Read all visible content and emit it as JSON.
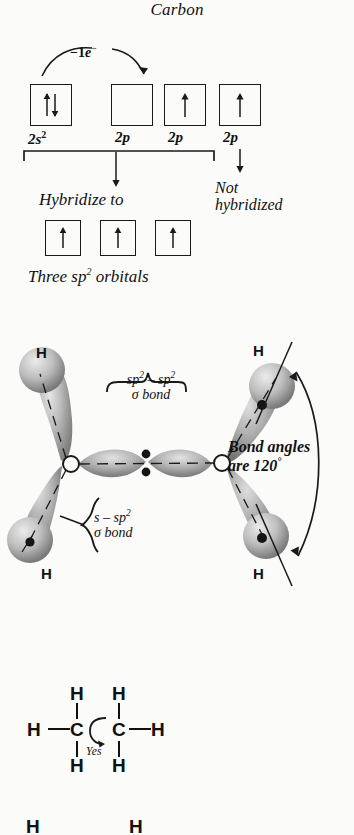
{
  "figure": {
    "title": "Carbon"
  },
  "orbital_diagram": {
    "promotion_label": "1e",
    "promotion_superscript": "−",
    "promotion_prefix": "−1",
    "boxes": [
      {
        "label_main": "2s",
        "label_sup": "2",
        "occupancy": "paired",
        "name": "2s-orbital-box"
      },
      {
        "label_main": "2p",
        "label_sup": "",
        "occupancy": "empty",
        "name": "2p-orbital-box-1"
      },
      {
        "label_main": "2p",
        "label_sup": "",
        "occupancy": "single",
        "name": "2p-orbital-box-2"
      },
      {
        "label_main": "2p",
        "label_sup": "",
        "occupancy": "single",
        "name": "2p-orbital-box-3"
      }
    ],
    "hybridize_caption": "Hybridize to",
    "not_hybridized_line1": "Not",
    "not_hybridized_line2": "hybridized",
    "hybrid_boxes": [
      {
        "occupancy": "single"
      },
      {
        "occupancy": "single"
      },
      {
        "occupancy": "single"
      }
    ],
    "hybrid_caption_pre": "Three sp",
    "hybrid_caption_sup": "2",
    "hybrid_caption_post": " orbitals"
  },
  "bonding_diagram": {
    "sigma_sp2_line1_pre": "sp",
    "sigma_sp2_line1_sup1": "2",
    "sigma_sp2_line1_mid": " – sp",
    "sigma_sp2_line1_sup2": "2",
    "sigma_sp2_line2": "σ bond",
    "sigma_s_line1_pre": "s – sp",
    "sigma_s_line1_sup": "2",
    "sigma_s_line2": "σ bond",
    "angle_line1": "Bond angles",
    "angle_line2_pre": "are 120",
    "angle_line2_sup": "°",
    "hydrogen_labels": [
      "H",
      "H",
      "H",
      "H"
    ]
  },
  "structure_ethane": {
    "carbon_left": "C",
    "carbon_right": "C",
    "h_left": "H",
    "h_right": "H",
    "h_top_left": "H",
    "h_top_right": "H",
    "h_bottom_left": "H",
    "h_bottom_right": "H",
    "rotation_label": "Yes"
  },
  "structure_partial": {
    "h_left": "H",
    "h_right": "H"
  },
  "colors": {
    "ink": "#111111",
    "paper": "#fbfbf9",
    "lobe_dark": "#8d8d8d",
    "lobe_light": "#cfcfcf"
  }
}
